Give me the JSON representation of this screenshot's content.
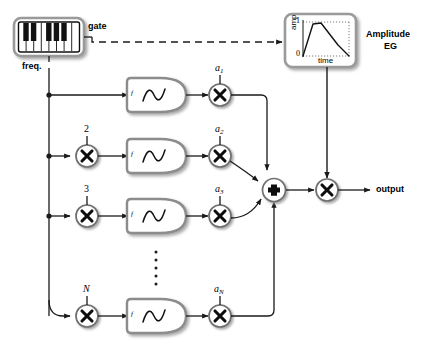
{
  "diagram": {
    "colors": {
      "line": "#1a1a1a",
      "shadow": "#b9b9b9",
      "box_fill": "#ffffff",
      "key_white": "#ffffff",
      "key_black": "#111111",
      "panel_border": "#555555"
    },
    "keyboard": {
      "name": "keyboard-controller",
      "white_keys": 8,
      "black_keys": 5
    },
    "labels": {
      "gate": "gate",
      "freq": "freq.",
      "output": "output",
      "amplitude_eg_line1": "Amplitude",
      "amplitude_eg_line2": "EG"
    },
    "eg_plot": {
      "ylabel": "amp",
      "xlabel": "time",
      "ytick_top": "1",
      "ytick_bottom": "0"
    },
    "osc_label": "f",
    "ellipsis_dots": 5,
    "partials": [
      {
        "harmonic": "",
        "amp_letter": "a",
        "amp_sub": "1",
        "has_multiplier": false
      },
      {
        "harmonic": "2",
        "amp_letter": "a",
        "amp_sub": "2",
        "has_multiplier": true
      },
      {
        "harmonic": "3",
        "amp_letter": "a",
        "amp_sub": "3",
        "has_multiplier": true
      },
      {
        "harmonic": "N",
        "amp_letter": "a",
        "amp_sub": "N",
        "has_multiplier": true
      }
    ],
    "sum_symbol": "+",
    "mult_symbol": "×"
  }
}
